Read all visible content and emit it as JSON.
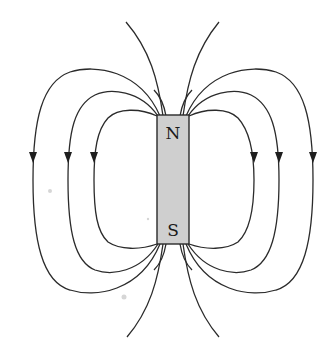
{
  "figure": {
    "magnet": {
      "north_label": "N",
      "south_label": "S",
      "fill_color": "#cfcfcf",
      "outline_color": "#2a2a2a"
    },
    "field_lines": {
      "color": "#2b2b2b",
      "closed_loops_per_side": 3,
      "open_lines_top": 2,
      "open_lines_bottom": 2,
      "arrow_direction": "down (from N to S outside magnet)"
    }
  }
}
